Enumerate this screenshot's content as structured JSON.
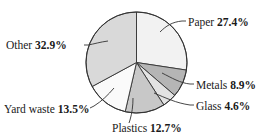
{
  "chart_data": {
    "type": "pie",
    "title": "",
    "subtitle": "",
    "xlabel": "",
    "ylabel": "",
    "legend_position": "callout-labels",
    "grid": false,
    "start_angle_deg": 0,
    "direction": "clockwise",
    "unit": "%",
    "categories": [
      "Paper",
      "Metals",
      "Glass",
      "Plastics",
      "Yard waste",
      "Other"
    ],
    "values": [
      27.4,
      8.9,
      4.6,
      12.7,
      13.5,
      32.9
    ],
    "colors": [
      "#f2f2f2",
      "#b5b5b5",
      "#e3e3e3",
      "#c8c8c8",
      "#fafafa",
      "#d9d9d9"
    ],
    "slices": [
      {
        "name": "Paper",
        "value": 27.4,
        "label": "Paper 27.4%",
        "color": "#f2f2f2"
      },
      {
        "name": "Metals",
        "value": 8.9,
        "label": "Metals 8.9%",
        "color": "#b5b5b5"
      },
      {
        "name": "Glass",
        "value": 4.6,
        "label": "Glass 4.6%",
        "color": "#e3e3e3"
      },
      {
        "name": "Plastics",
        "value": 12.7,
        "label": "Plastics 12.7%",
        "color": "#c8c8c8"
      },
      {
        "name": "Yard waste",
        "value": 13.5,
        "label": "Yard waste 13.5%",
        "color": "#fafafa"
      },
      {
        "name": "Other",
        "value": 32.9,
        "label": "Other 32.9%",
        "color": "#d9d9d9"
      }
    ]
  },
  "labels": {
    "paper": {
      "name": "Paper ",
      "pct": "27.4%"
    },
    "other": {
      "name": "Other ",
      "pct": "32.9%"
    },
    "metals": {
      "name": "Metals ",
      "pct": "8.9%"
    },
    "glass": {
      "name": "Glass ",
      "pct": "4.6%"
    },
    "yard_waste": {
      "name": "Yard waste ",
      "pct": "13.5%"
    },
    "plastics": {
      "name": "Plastics ",
      "pct": "12.7%"
    }
  },
  "style": {
    "background": "#ffffff",
    "outline": "#333333",
    "text": "#1a1a1a"
  }
}
